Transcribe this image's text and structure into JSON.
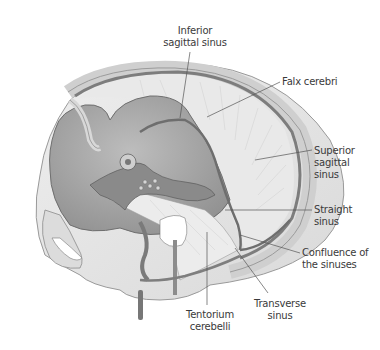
{
  "figure": {
    "colors": {
      "background": "#ffffff",
      "skull_outer": "#e6e6e6",
      "skull_rim": "#d2d2d2",
      "dura": "#c7c7c7",
      "sinus": "#7a7a7a",
      "brain_cavity": "#a9a9a9",
      "leader_line": "#555555",
      "label_text": "#3a3a3a"
    }
  },
  "labels": [
    {
      "id": "inferior-sagittal-sinus",
      "text": "Inferior\nsagittal sinus"
    },
    {
      "id": "falx-cerebri",
      "text": "Falx cerebri"
    },
    {
      "id": "superior-sagittal-sinus",
      "text": "Superior\nsagittal\nsinus"
    },
    {
      "id": "straight-sinus",
      "text": "Straight\nsinus"
    },
    {
      "id": "confluence-of-the-sinuses",
      "text": "Confluence of\nthe sinuses"
    },
    {
      "id": "transverse-sinus",
      "text": "Transverse\nsinus"
    },
    {
      "id": "tentorium-cerebelli",
      "text": "Tentorium\ncerebelli"
    }
  ]
}
